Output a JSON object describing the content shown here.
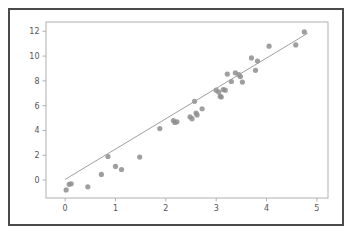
{
  "figure": {
    "background_color": "#ffffff",
    "frame_color": "#4a4a4a",
    "axes_color": "#b0b0b0"
  },
  "chart_data": {
    "type": "scatter",
    "title": "",
    "xlabel": "",
    "ylabel": "",
    "xlim": [
      -0.38,
      5.22
    ],
    "ylim": [
      -1.45,
      12.75
    ],
    "grid": false,
    "legend": null,
    "marker_color": "#8e8e8e",
    "line_color": "#a0a0a0",
    "xticks": [
      0,
      1,
      2,
      3,
      4,
      5
    ],
    "xticklabels": [
      "0",
      "1",
      "2",
      "3",
      "4",
      "5"
    ],
    "yticks": [
      0,
      2,
      4,
      6,
      8,
      10,
      12
    ],
    "yticklabels": [
      "0",
      "2",
      "4",
      "6",
      "8",
      "10",
      "12"
    ],
    "series": [
      {
        "name": "observations",
        "kind": "scatter",
        "points": [
          [
            0.02,
            -0.8
          ],
          [
            0.08,
            -0.35
          ],
          [
            0.12,
            -0.3
          ],
          [
            0.45,
            -0.55
          ],
          [
            0.72,
            0.45
          ],
          [
            0.85,
            1.9
          ],
          [
            1.0,
            1.1
          ],
          [
            1.12,
            0.85
          ],
          [
            1.48,
            1.85
          ],
          [
            1.88,
            4.15
          ],
          [
            2.15,
            4.8
          ],
          [
            2.18,
            4.65
          ],
          [
            2.22,
            4.7
          ],
          [
            2.48,
            5.1
          ],
          [
            2.52,
            4.95
          ],
          [
            2.57,
            6.35
          ],
          [
            2.6,
            5.4
          ],
          [
            2.62,
            5.25
          ],
          [
            2.72,
            5.75
          ],
          [
            3.0,
            7.25
          ],
          [
            3.05,
            7.1
          ],
          [
            3.08,
            6.75
          ],
          [
            3.1,
            6.7
          ],
          [
            3.14,
            7.3
          ],
          [
            3.18,
            7.25
          ],
          [
            3.22,
            8.55
          ],
          [
            3.3,
            7.95
          ],
          [
            3.38,
            8.65
          ],
          [
            3.45,
            8.5
          ],
          [
            3.48,
            8.35
          ],
          [
            3.52,
            7.9
          ],
          [
            3.7,
            9.85
          ],
          [
            3.78,
            8.85
          ],
          [
            3.82,
            9.6
          ],
          [
            4.05,
            10.8
          ],
          [
            4.58,
            10.9
          ],
          [
            4.75,
            11.95
          ]
        ]
      },
      {
        "name": "fitted-line",
        "kind": "line",
        "points": [
          [
            0.0,
            0.05
          ],
          [
            4.82,
            11.85
          ]
        ]
      }
    ]
  }
}
